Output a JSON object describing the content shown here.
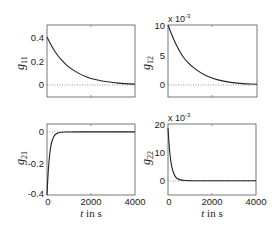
{
  "chart_data": [
    {
      "type": "line",
      "id": "g11",
      "ylabel": "g",
      "ylabel_sub": "11",
      "xlabel": "",
      "xlim": [
        0,
        4000
      ],
      "ylim": [
        -0.1,
        0.5
      ],
      "yticks": [
        0,
        0.2,
        0.4
      ],
      "ytick_labels": [
        "0",
        "0.2",
        "0.4"
      ],
      "xticks": [
        0,
        2000,
        4000
      ],
      "xtick_labels": [],
      "exponent_label": "",
      "zero_line": "dotted",
      "series": [
        {
          "name": "g11",
          "x": [
            0,
            250,
            500,
            750,
            1000,
            1500,
            2000,
            2500,
            3000,
            3500,
            4000
          ],
          "values": [
            0.4,
            0.31,
            0.24,
            0.19,
            0.147,
            0.089,
            0.054,
            0.033,
            0.02,
            0.012,
            0.007
          ]
        }
      ]
    },
    {
      "type": "line",
      "id": "g12",
      "ylabel": "g",
      "ylabel_sub": "12",
      "xlabel": "",
      "xlim": [
        0,
        4000
      ],
      "ylim": [
        -2,
        10
      ],
      "yticks": [
        0,
        5,
        10
      ],
      "ytick_labels": [
        "0",
        "5",
        "10"
      ],
      "xticks": [
        0,
        2000,
        4000
      ],
      "xtick_labels": [],
      "exponent_label": "x 10",
      "exponent_power": "-3",
      "zero_line": "dotted",
      "series": [
        {
          "name": "g12",
          "x": [
            0,
            250,
            500,
            750,
            1000,
            1500,
            2000,
            2500,
            3000,
            3500,
            4000
          ],
          "values": [
            10,
            7.6,
            5.7,
            4.3,
            3.3,
            1.9,
            1.1,
            0.6,
            0.35,
            0.2,
            0.12
          ]
        }
      ]
    },
    {
      "type": "line",
      "id": "g21",
      "ylabel": "g",
      "ylabel_sub": "21",
      "xlabel": "t  in s",
      "xlim": [
        0,
        4000
      ],
      "ylim": [
        -0.4,
        0.05
      ],
      "yticks": [
        -0.4,
        -0.2,
        0
      ],
      "ytick_labels": [
        "-0.4",
        "-0.2",
        "0"
      ],
      "xticks": [
        0,
        2000,
        4000
      ],
      "xtick_labels": [
        "0",
        "2000",
        "4000"
      ],
      "exponent_label": "",
      "zero_line": "dotted",
      "series": [
        {
          "name": "g21",
          "x": [
            0,
            50,
            100,
            150,
            200,
            300,
            400,
            600,
            1000,
            2000,
            4000
          ],
          "values": [
            -0.4,
            -0.26,
            -0.17,
            -0.11,
            -0.07,
            -0.03,
            -0.012,
            -0.002,
            0,
            0,
            0
          ]
        }
      ]
    },
    {
      "type": "line",
      "id": "g22",
      "ylabel": "g",
      "ylabel_sub": "22",
      "xlabel": "t  in s",
      "xlim": [
        0,
        4000
      ],
      "ylim": [
        -5,
        20
      ],
      "yticks": [
        0,
        10,
        20
      ],
      "ytick_labels": [
        "0",
        "10",
        "20"
      ],
      "xticks": [
        0,
        2000,
        4000
      ],
      "xtick_labels": [
        "0",
        "2000",
        "4000"
      ],
      "exponent_label": "x 10",
      "exponent_power": "-3",
      "zero_line": "dotted",
      "series": [
        {
          "name": "g22",
          "x": [
            0,
            50,
            100,
            150,
            200,
            300,
            400,
            600,
            1000,
            2000,
            4000
          ],
          "values": [
            18.5,
            12.5,
            8.5,
            5.7,
            3.9,
            1.8,
            0.8,
            0.2,
            0,
            0,
            0
          ]
        }
      ]
    }
  ],
  "panels": {
    "g11": {
      "ylabel": "g",
      "sub": "11",
      "t0": "0.4",
      "t1": "0.2",
      "t2": "0"
    },
    "g12": {
      "ylabel": "g",
      "sub": "12",
      "t0": "10",
      "t1": "5",
      "t2": "0",
      "exp": "x 10",
      "exp_pow": "-3"
    },
    "g21": {
      "ylabel": "g",
      "sub": "21",
      "t0": "0",
      "t1": "-0.2",
      "t2": "-0.4",
      "x0": "0",
      "x1": "2000",
      "x2": "4000",
      "xlabel_t": "t",
      "xlabel_rest": " in s"
    },
    "g22": {
      "ylabel": "g",
      "sub": "22",
      "t0": "20",
      "t1": "10",
      "t2": "0",
      "x0": "0",
      "x1": "2000",
      "x2": "4000",
      "xlabel_t": "t",
      "xlabel_rest": " in s",
      "exp": "x 10",
      "exp_pow": "-3"
    }
  },
  "colors": {
    "line": "#222222",
    "axes": "#555555",
    "zero_line": "#777777",
    "background": "#ffffff"
  }
}
